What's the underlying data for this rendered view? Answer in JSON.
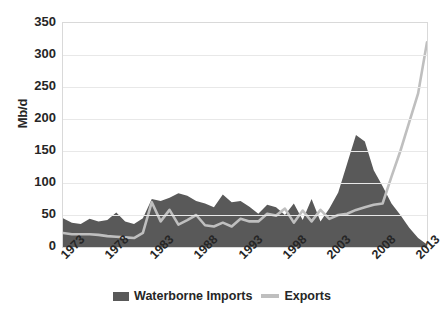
{
  "chart_data": {
    "type": "area",
    "title": "",
    "xlabel": "",
    "ylabel": "Mb/d",
    "ylim": [
      0,
      350
    ],
    "xlim": [
      1973,
      2014
    ],
    "grid": true,
    "legend_position": "bottom",
    "ytick_labels": [
      "350",
      "300",
      "250",
      "200",
      "150",
      "100",
      "50",
      "0"
    ],
    "ytick_values": [
      350,
      300,
      250,
      200,
      150,
      100,
      50,
      0
    ],
    "xtick_labels": [
      "1973",
      "1978",
      "1983",
      "1988",
      "1993",
      "1998",
      "2003",
      "2008",
      "2013"
    ],
    "xtick_values": [
      1973,
      1978,
      1983,
      1988,
      1993,
      1998,
      2003,
      2008,
      2013
    ],
    "x": [
      1973,
      1974,
      1975,
      1976,
      1977,
      1978,
      1979,
      1980,
      1981,
      1982,
      1983,
      1984,
      1985,
      1986,
      1987,
      1988,
      1989,
      1990,
      1991,
      1992,
      1993,
      1994,
      1995,
      1996,
      1997,
      1998,
      1999,
      2000,
      2001,
      2002,
      2003,
      2004,
      2005,
      2006,
      2007,
      2008,
      2009,
      2010,
      2011,
      2012,
      2013,
      2014
    ],
    "series": [
      {
        "name": "Waterborne Imports",
        "color": "#595959",
        "kind": "area",
        "values": [
          45,
          38,
          36,
          44,
          40,
          42,
          54,
          40,
          36,
          45,
          75,
          72,
          77,
          84,
          80,
          72,
          68,
          62,
          82,
          70,
          72,
          63,
          52,
          66,
          62,
          50,
          68,
          42,
          75,
          40,
          60,
          85,
          130,
          175,
          165,
          120,
          95,
          68,
          50,
          30,
          14,
          4
        ]
      },
      {
        "name": "Exports",
        "color": "#bfbfbf",
        "kind": "line",
        "values": [
          22,
          20,
          20,
          20,
          19,
          17,
          16,
          15,
          14,
          22,
          70,
          40,
          58,
          35,
          42,
          50,
          34,
          32,
          38,
          32,
          44,
          40,
          40,
          52,
          49,
          60,
          38,
          57,
          40,
          58,
          44,
          50,
          52,
          58,
          62,
          66,
          68,
          110,
          150,
          195,
          240,
          320
        ]
      }
    ]
  },
  "legend": {
    "items": [
      {
        "label": "Waterborne Imports",
        "swatch": "area-swatch"
      },
      {
        "label": "Exports",
        "swatch": "line-swatch"
      }
    ]
  }
}
